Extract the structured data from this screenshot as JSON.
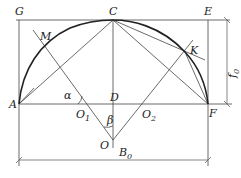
{
  "figure": {
    "type": "geometric construction of a circular arc (three-center / rise f0)",
    "points": {
      "G": {
        "label": "G"
      },
      "C": {
        "label": "C"
      },
      "E": {
        "label": "E"
      },
      "M": {
        "label": "M"
      },
      "K": {
        "label": "K"
      },
      "A": {
        "label": "A"
      },
      "D": {
        "label": "D"
      },
      "F": {
        "label": "F"
      },
      "O1": {
        "label": "O",
        "sub": "1"
      },
      "O2": {
        "label": "O",
        "sub": "2"
      },
      "O": {
        "label": "O"
      },
      "B0": {
        "label": "B",
        "sub": "0"
      }
    },
    "angles": {
      "alpha": "α",
      "beta": "β"
    },
    "dimensions": {
      "rise": {
        "label": "f",
        "sub": "0"
      },
      "span": {
        "label": "B",
        "sub": "0"
      }
    }
  }
}
